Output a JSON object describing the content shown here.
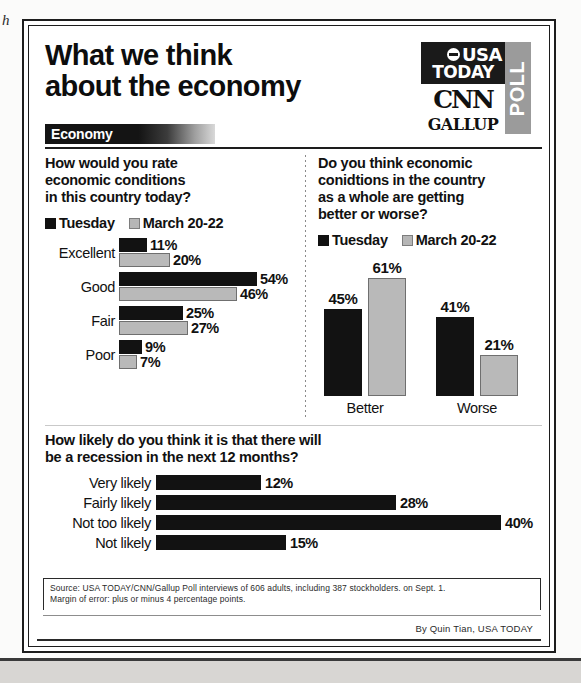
{
  "artifact": {
    "stray_char": "h"
  },
  "headline": {
    "line1": "What we think",
    "line2": "about the economy"
  },
  "logo": {
    "usa": "USA",
    "today": "TODAY",
    "cnn": "CNN",
    "gallup": "GALLUP",
    "poll": "POLL",
    "globe_icon": "globe-icon"
  },
  "section_banner": {
    "label": "Economy"
  },
  "legend": {
    "series1_label": "Tuesday",
    "series2_label": "March 20-22",
    "series1_color": "#111111",
    "series2_color": "#b6b6b6"
  },
  "left_chart": {
    "question": {
      "l1": "How would you rate",
      "l2": "economic conditions",
      "l3": "in this country today?"
    }
  },
  "right_chart": {
    "question": {
      "l1": "Do you think economic",
      "l2": "conidtions in the country",
      "l3": "as a whole are getting",
      "l4": "better or worse?"
    }
  },
  "bottom_chart": {
    "question": {
      "l1": "How likely do you think it is that there will",
      "l2": "be a recession in the next 12 months?"
    }
  },
  "footer": {
    "source_line1": "Source: USA TODAY/CNN/Gallup Poll interviews of 606 adults, including 387 stockholders. on Sept. 1.",
    "source_line2": "Margin of error: plus or minus 4 percentage points.",
    "byline": "By Quin Tian, USA TODAY"
  },
  "chart_data": [
    {
      "type": "bar",
      "id": "economic-conditions-rating",
      "orientation": "horizontal",
      "title": "How would you rate economic conditions in this country today?",
      "xlabel": "",
      "ylabel": "",
      "categories": [
        "Excellent",
        "Good",
        "Fair",
        "Poor"
      ],
      "series": [
        {
          "name": "Tuesday",
          "color": "#111111",
          "values": [
            11,
            54,
            25,
            9
          ],
          "labels": [
            "11%",
            "54%",
            "25%",
            "9%"
          ]
        },
        {
          "name": "March 20-22",
          "color": "#b6b6b6",
          "values": [
            20,
            46,
            27,
            7
          ],
          "labels": [
            "20%",
            "46%",
            "27%",
            "7%"
          ]
        }
      ],
      "value_suffix": "%",
      "xlim": [
        0,
        54
      ],
      "grid": false,
      "legend_position": "top-left"
    },
    {
      "type": "bar",
      "id": "economy-getting-better-or-worse",
      "orientation": "vertical",
      "title": "Do you think economic conidtions in the country as a whole are getting better or worse?",
      "xlabel": "",
      "ylabel": "",
      "categories": [
        "Better",
        "Worse"
      ],
      "series": [
        {
          "name": "Tuesday",
          "color": "#111111",
          "values": [
            45,
            41
          ],
          "labels": [
            "45%",
            "41%"
          ]
        },
        {
          "name": "March 20-22",
          "color": "#b6b6b6",
          "values": [
            61,
            21
          ],
          "labels": [
            "61%",
            "21%"
          ]
        }
      ],
      "value_suffix": "%",
      "ylim": [
        0,
        61
      ],
      "grid": false,
      "legend_position": "top-left"
    },
    {
      "type": "bar",
      "id": "recession-likelihood",
      "orientation": "horizontal",
      "title": "How likely do you think it is that there will be a recession in the next 12 months?",
      "xlabel": "",
      "ylabel": "",
      "categories": [
        "Very likely",
        "Fairly likely",
        "Not too likely",
        "Not likely"
      ],
      "series": [
        {
          "name": "Percent",
          "color": "#121212",
          "values": [
            12,
            28,
            40,
            15
          ],
          "labels": [
            "12%",
            "28%",
            "40%",
            "15%"
          ],
          "bar_pixel_widths": [
            105,
            240,
            345,
            130
          ]
        }
      ],
      "value_suffix": "%",
      "xlim": [
        0,
        40
      ],
      "grid": false,
      "legend_position": "none"
    }
  ]
}
